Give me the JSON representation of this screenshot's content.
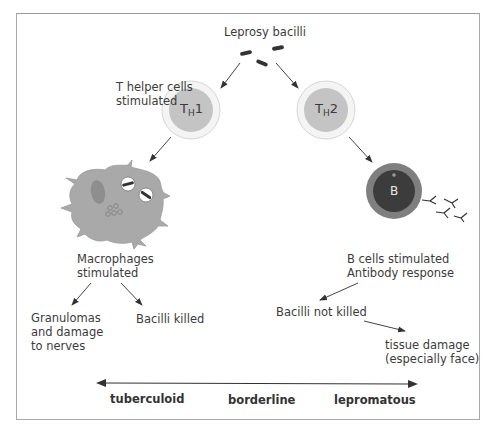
{
  "labels": {
    "leprosy_bacilli": "Leprosy bacilli",
    "t_helper_line1": "T helper cells",
    "t_helper_line2": "stimulated",
    "th1_main": "T",
    "th1_sub": "H",
    "th1_num": "1",
    "th2_main": "T",
    "th2_sub": "H",
    "th2_num": "2",
    "b_cell": "B",
    "macrophages_line1": "Macrophages",
    "macrophages_line2": "stimulated",
    "granulomas_line1": "Granulomas",
    "granulomas_line2": "and damage",
    "granulomas_line3": "to nerves",
    "bacilli_killed": "Bacilli killed",
    "b_cells_line1": "B cells stimulated",
    "b_cells_line2": "Antibody response",
    "bacilli_not_killed": "Bacilli not killed",
    "tissue_line1": "tissue damage",
    "tissue_line2": "(especially face)"
  },
  "spectrum": {
    "left": "tuberculoid",
    "middle": "borderline",
    "right": "lepromatous"
  },
  "colors": {
    "cell_fill": "#c4c4c4",
    "cell_ring": "#e6e6e6",
    "b_cell_outer": "#7f7f7f",
    "b_cell_inner": "#3c3c3c",
    "macrophage": "#a9a9a9",
    "arrow": "#333333"
  }
}
